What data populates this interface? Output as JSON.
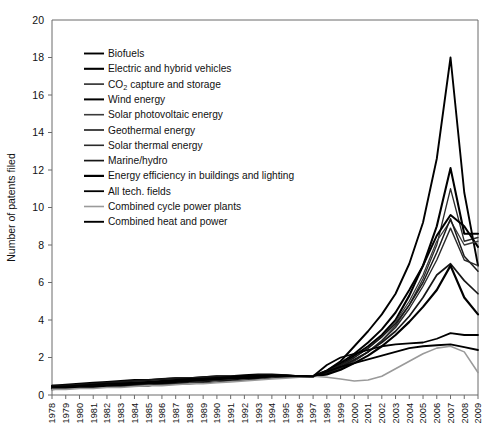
{
  "chart_data": {
    "type": "line",
    "title": "",
    "xlabel": "",
    "ylabel": "Number of patents filed",
    "ylim": [
      0,
      20
    ],
    "yticks": [
      0,
      2,
      4,
      6,
      8,
      10,
      12,
      14,
      16,
      18,
      20
    ],
    "grid": false,
    "legend_position": "upper-left inside plot",
    "x": [
      1978,
      1979,
      1980,
      1981,
      1982,
      1983,
      1984,
      1985,
      1986,
      1987,
      1988,
      1989,
      1990,
      1991,
      1992,
      1993,
      1994,
      1995,
      1996,
      1997,
      1998,
      1999,
      2000,
      2001,
      2002,
      2003,
      2004,
      2005,
      2006,
      2007,
      2008,
      2009
    ],
    "xtick_labels": [
      "1978",
      "1979",
      "1980",
      "1981",
      "1982",
      "1983",
      "1984",
      "1985",
      "1986",
      "1987",
      "1988",
      "1989",
      "1990",
      "1991",
      "1992",
      "1993",
      "1994",
      "1995",
      "1996",
      "1997",
      "1998",
      "1999",
      "2000",
      "2001",
      "2002",
      "2003",
      "2004",
      "2005",
      "2006",
      "2007",
      "2008",
      "2009"
    ],
    "series": [
      {
        "name": "Biofuels",
        "color": "#000000",
        "width": 1.9,
        "values": [
          0.4,
          0.4,
          0.4,
          0.4,
          0.5,
          0.5,
          0.5,
          0.5,
          0.6,
          0.6,
          0.7,
          0.7,
          0.8,
          0.8,
          0.9,
          0.9,
          1.0,
          1.0,
          1.0,
          1.0,
          1.3,
          1.8,
          2.6,
          3.4,
          4.3,
          5.4,
          7.0,
          9.2,
          12.6,
          18.0,
          10.8,
          6.9
        ]
      },
      {
        "name": "Electric and hybrid vehicles",
        "color": "#000000",
        "width": 2.1,
        "values": [
          0.45,
          0.45,
          0.5,
          0.5,
          0.55,
          0.6,
          0.6,
          0.65,
          0.7,
          0.75,
          0.8,
          0.85,
          0.9,
          0.9,
          0.95,
          1.0,
          1.0,
          1.0,
          1.0,
          1.0,
          1.2,
          1.6,
          2.1,
          2.6,
          3.2,
          4.0,
          5.3,
          6.9,
          9.0,
          12.1,
          8.6,
          8.6
        ]
      },
      {
        "name": "CO₂ capture and storage",
        "color": "#2b2b2b",
        "width": 1.3,
        "values": [
          0.35,
          0.35,
          0.4,
          0.4,
          0.45,
          0.45,
          0.5,
          0.5,
          0.55,
          0.6,
          0.6,
          0.65,
          0.7,
          0.75,
          0.8,
          0.85,
          0.9,
          0.95,
          1.0,
          1.0,
          1.1,
          1.4,
          1.8,
          2.3,
          2.9,
          3.7,
          4.8,
          6.2,
          8.0,
          11.0,
          8.2,
          8.4
        ]
      },
      {
        "name": "Wind energy",
        "color": "#000000",
        "width": 2.0,
        "values": [
          0.5,
          0.55,
          0.6,
          0.65,
          0.7,
          0.75,
          0.8,
          0.8,
          0.85,
          0.9,
          0.9,
          0.95,
          1.0,
          1.0,
          1.05,
          1.1,
          1.1,
          1.05,
          1.0,
          1.0,
          1.3,
          1.7,
          2.2,
          2.8,
          3.5,
          4.4,
          5.6,
          6.9,
          8.5,
          9.6,
          9.0,
          7.9
        ]
      },
      {
        "name": "Solar photovoltaic energy",
        "color": "#3a3a3a",
        "width": 1.3,
        "values": [
          0.4,
          0.4,
          0.45,
          0.5,
          0.5,
          0.55,
          0.6,
          0.6,
          0.65,
          0.7,
          0.7,
          0.75,
          0.8,
          0.85,
          0.9,
          0.95,
          1.0,
          1.0,
          1.0,
          1.0,
          1.2,
          1.5,
          2.0,
          2.5,
          3.1,
          3.9,
          5.0,
          6.4,
          8.2,
          9.3,
          8.0,
          8.2
        ]
      },
      {
        "name": "Geothermal energy",
        "color": "#1a1a1a",
        "width": 1.5,
        "values": [
          0.45,
          0.5,
          0.5,
          0.55,
          0.6,
          0.65,
          0.7,
          0.7,
          0.75,
          0.8,
          0.85,
          0.9,
          0.9,
          0.95,
          1.0,
          1.0,
          1.05,
          1.05,
          1.0,
          1.0,
          1.25,
          1.6,
          2.0,
          2.5,
          3.1,
          3.8,
          4.8,
          6.0,
          7.6,
          9.4,
          7.4,
          6.6
        ]
      },
      {
        "name": "Solar thermal energy",
        "color": "#2a2a2a",
        "width": 1.4,
        "values": [
          0.4,
          0.45,
          0.5,
          0.5,
          0.55,
          0.6,
          0.6,
          0.65,
          0.7,
          0.75,
          0.8,
          0.8,
          0.85,
          0.9,
          0.95,
          1.0,
          1.0,
          1.0,
          1.0,
          1.0,
          1.15,
          1.45,
          1.85,
          2.3,
          2.9,
          3.6,
          4.6,
          5.8,
          7.2,
          8.9,
          7.2,
          6.9
        ]
      },
      {
        "name": "Marine/hydro",
        "color": "#161616",
        "width": 1.7,
        "values": [
          0.5,
          0.5,
          0.55,
          0.6,
          0.65,
          0.7,
          0.75,
          0.8,
          0.85,
          0.9,
          0.9,
          0.95,
          1.0,
          1.0,
          1.0,
          1.05,
          1.05,
          1.0,
          1.0,
          1.0,
          1.2,
          1.5,
          1.9,
          2.3,
          2.8,
          3.4,
          4.2,
          5.2,
          6.4,
          7.0,
          6.1,
          5.4
        ]
      },
      {
        "name": "Energy efficiency in buildings and lighting",
        "color": "#000000",
        "width": 2.2,
        "values": [
          0.35,
          0.4,
          0.4,
          0.45,
          0.5,
          0.55,
          0.6,
          0.6,
          0.65,
          0.7,
          0.75,
          0.8,
          0.85,
          0.9,
          0.9,
          0.95,
          1.0,
          1.0,
          1.0,
          1.0,
          1.1,
          1.35,
          1.7,
          2.1,
          2.6,
          3.2,
          3.9,
          4.7,
          5.6,
          6.9,
          5.2,
          4.3
        ]
      },
      {
        "name": "All tech. fields",
        "color": "#000000",
        "width": 1.8,
        "values": [
          0.3,
          0.35,
          0.4,
          0.45,
          0.5,
          0.55,
          0.6,
          0.65,
          0.7,
          0.75,
          0.8,
          0.85,
          0.9,
          0.95,
          1.0,
          1.0,
          1.05,
          1.05,
          1.0,
          1.0,
          1.6,
          2.0,
          2.2,
          2.4,
          2.6,
          2.7,
          2.75,
          2.8,
          3.0,
          3.3,
          3.2,
          3.2
        ]
      },
      {
        "name": "Combined cycle power plants",
        "color": "#9a9a9a",
        "width": 1.6,
        "values": [
          0.3,
          0.3,
          0.35,
          0.35,
          0.4,
          0.4,
          0.45,
          0.5,
          0.5,
          0.55,
          0.6,
          0.6,
          0.65,
          0.7,
          0.75,
          0.8,
          0.85,
          0.9,
          0.95,
          1.0,
          0.95,
          0.85,
          0.75,
          0.8,
          1.0,
          1.4,
          1.8,
          2.2,
          2.5,
          2.6,
          2.3,
          1.2
        ]
      },
      {
        "name": "Combined heat and power",
        "color": "#000000",
        "width": 1.9,
        "values": [
          0.45,
          0.45,
          0.5,
          0.55,
          0.6,
          0.6,
          0.65,
          0.7,
          0.75,
          0.8,
          0.85,
          0.85,
          0.9,
          0.95,
          1.0,
          1.0,
          1.0,
          1.0,
          1.0,
          1.0,
          1.25,
          1.5,
          1.7,
          1.9,
          2.1,
          2.3,
          2.5,
          2.6,
          2.65,
          2.7,
          2.55,
          2.4
        ]
      }
    ]
  },
  "legend": {
    "entries": [
      {
        "label": "Biofuels"
      },
      {
        "label": "Electric and hybrid vehicles"
      },
      {
        "label_pre": "CO",
        "label_sub": "2",
        "label_post": " capture and storage"
      },
      {
        "label": "Wind energy"
      },
      {
        "label": "Solar photovoltaic energy"
      },
      {
        "label": "Geothermal energy"
      },
      {
        "label": "Solar thermal energy"
      },
      {
        "label": "Marine/hydro"
      },
      {
        "label": "Energy efficiency in buildings and lighting"
      },
      {
        "label": "All tech. fields"
      },
      {
        "label": "Combined cycle power plants"
      },
      {
        "label": "Combined heat and power"
      }
    ]
  }
}
